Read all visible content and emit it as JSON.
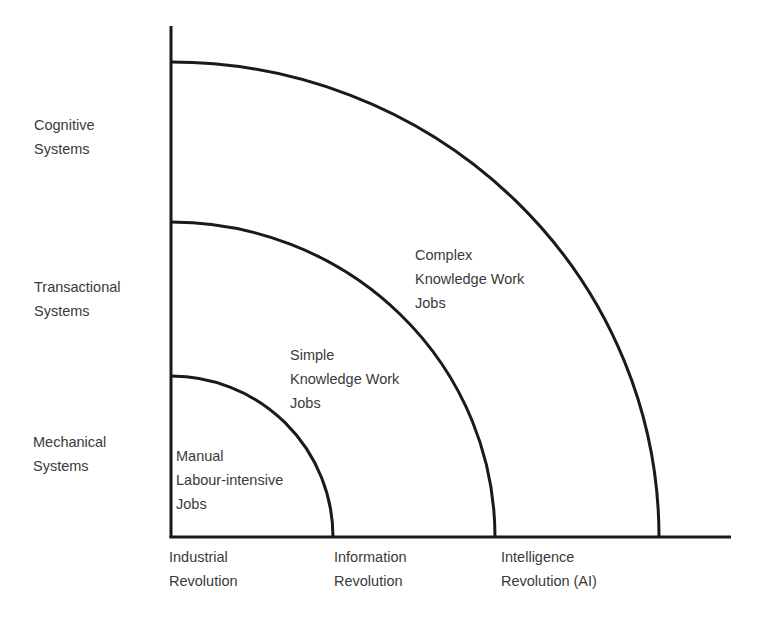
{
  "diagram": {
    "type": "quadrant-arcs",
    "stroke_color": "#1a1a1a",
    "text_color": "#3a3a3a",
    "y_axis_labels": [
      {
        "id": "cognitive",
        "lines": [
          "Cognitive",
          "Systems"
        ]
      },
      {
        "id": "transactional",
        "lines": [
          "Transactional",
          "Systems"
        ]
      },
      {
        "id": "mechanical",
        "lines": [
          "Mechanical",
          "Systems"
        ]
      }
    ],
    "x_axis_labels": [
      {
        "id": "industrial",
        "lines": [
          "Industrial",
          "Revolution"
        ]
      },
      {
        "id": "information",
        "lines": [
          "Information",
          "Revolution"
        ]
      },
      {
        "id": "intelligence",
        "lines": [
          "Intelligence",
          "Revolution (AI)"
        ]
      }
    ],
    "regions": [
      {
        "id": "manual",
        "lines": [
          "Manual",
          "Labour-intensive",
          "Jobs"
        ]
      },
      {
        "id": "simple",
        "lines": [
          "Simple",
          "Knowledge Work",
          "Jobs"
        ]
      },
      {
        "id": "complex",
        "lines": [
          "Complex",
          "Knowledge Work",
          "Jobs"
        ]
      }
    ]
  }
}
